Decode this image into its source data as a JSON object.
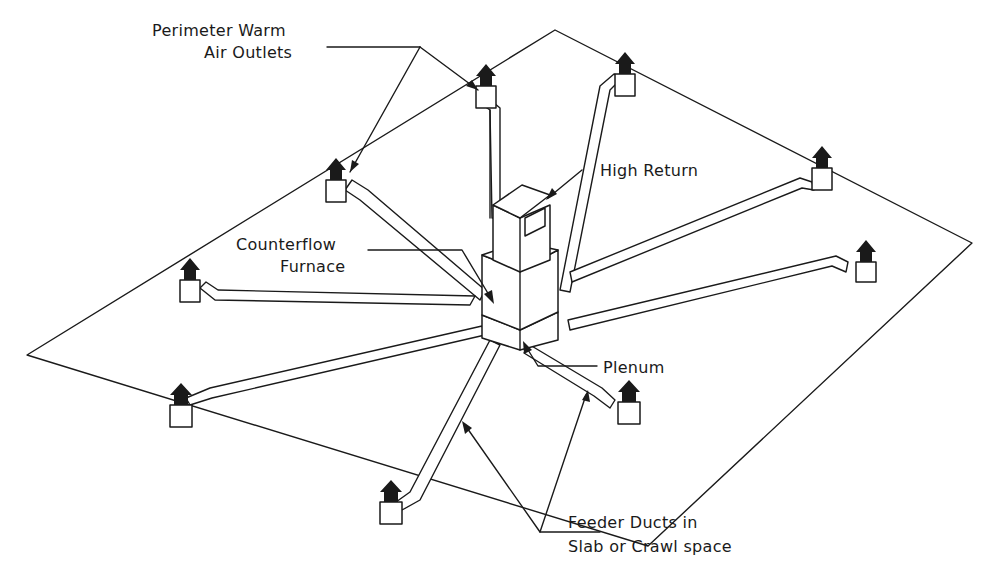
{
  "diagram": {
    "type": "isometric-hvac-perimeter-duct-system",
    "labels": {
      "perimeter_outlets": [
        "Perimeter Warm",
        "Air Outlets"
      ],
      "high_return": "High Return",
      "furnace": [
        "Counterflow",
        "Furnace"
      ],
      "plenum": "Plenum",
      "feeder_ducts": [
        "Feeder Ducts in",
        "Slab or Crawl space"
      ]
    },
    "components": [
      "slab-outline",
      "counterflow-furnace",
      "high-return",
      "plenum",
      "feeder-ducts",
      "perimeter-warm-air-outlets"
    ],
    "outlet_count": 8,
    "colors": {
      "line": "#1a1a1a",
      "background": "#ffffff"
    }
  }
}
